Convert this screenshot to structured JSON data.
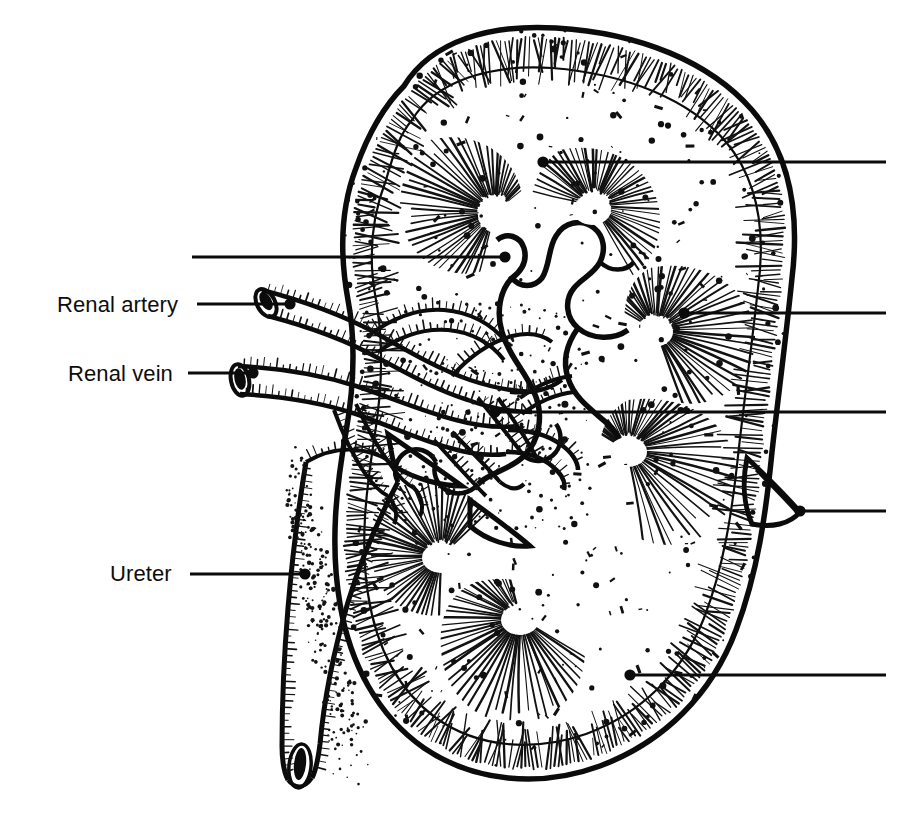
{
  "figure": {
    "background_color": "#ffffff",
    "ink_color": "#0b0b0b",
    "width": 920,
    "height": 821,
    "style": "black-and-white line engraving / stipple illustration"
  },
  "labels": [
    {
      "id": "renal-artery",
      "text": "Renal artery",
      "text_x": 57,
      "text_y": 312,
      "anchor": "start",
      "leader_from_x": 197,
      "leader_to_x": 288,
      "leader_y": 304,
      "dot_x": 290,
      "dot_y": 304,
      "has_dot": true,
      "side": "left"
    },
    {
      "id": "renal-vein",
      "text": "Renal vein",
      "text_x": 68,
      "text_y": 381,
      "anchor": "start",
      "leader_from_x": 188,
      "leader_to_x": 251,
      "leader_y": 373,
      "dot_x": 253,
      "dot_y": 373,
      "has_dot": true,
      "side": "left"
    },
    {
      "id": "ureter",
      "text": "Ureter",
      "text_x": 110,
      "text_y": 581,
      "anchor": "start",
      "leader_from_x": 190,
      "leader_to_x": 303,
      "leader_y": 574,
      "dot_x": 305,
      "dot_y": 574,
      "has_dot": true,
      "side": "left"
    }
  ],
  "unlabeled_leaders": [
    {
      "id": "leader-cortex-upper",
      "text": "",
      "leader_from_x": 543,
      "leader_to_x": 886,
      "leader_y": 162,
      "dot_x": 543,
      "dot_y": 162,
      "has_dot": true,
      "side": "right"
    },
    {
      "id": "leader-renal-column",
      "text": "",
      "leader_from_x": 192,
      "leader_to_x": 503,
      "leader_y": 257,
      "dot_x": 505,
      "dot_y": 257,
      "has_dot": true,
      "side": "left"
    },
    {
      "id": "leader-medulla-pyramid",
      "text": "",
      "leader_from_x": 686,
      "leader_to_x": 886,
      "leader_y": 313,
      "dot_x": 684,
      "dot_y": 313,
      "has_dot": true,
      "side": "right"
    },
    {
      "id": "leader-renal-pelvis",
      "text": "",
      "leader_from_x": 497,
      "leader_to_x": 886,
      "leader_y": 412,
      "dot_x": 495,
      "dot_y": 412,
      "has_dot": true,
      "side": "right"
    },
    {
      "id": "leader-renal-capsule",
      "text": "",
      "leader_from_x": 802,
      "leader_to_x": 886,
      "leader_y": 511,
      "dot_x": 800,
      "dot_y": 511,
      "has_dot": true,
      "side": "right"
    },
    {
      "id": "leader-cortex-lower",
      "text": "",
      "leader_from_x": 632,
      "leader_to_x": 886,
      "leader_y": 675,
      "dot_x": 630,
      "dot_y": 675,
      "has_dot": true,
      "side": "right"
    }
  ],
  "structures": [
    {
      "id": "kidney-outline",
      "name": "kidney capsule outline"
    },
    {
      "id": "renal-cortex",
      "name": "renal cortex (outer stippled band)"
    },
    {
      "id": "renal-pyramids",
      "name": "renal pyramids (radiating striations)"
    },
    {
      "id": "renal-papillae",
      "name": "renal papillae"
    },
    {
      "id": "minor-calyces",
      "name": "minor calyces"
    },
    {
      "id": "renal-pelvis",
      "name": "renal pelvis"
    },
    {
      "id": "renal-artery-vessel",
      "name": "renal artery and segmental branches"
    },
    {
      "id": "renal-vein-vessel",
      "name": "renal vein and tributaries"
    },
    {
      "id": "ureter-tube",
      "name": "ureter"
    },
    {
      "id": "renal-capsule-flap",
      "name": "reflected renal capsule flap"
    }
  ]
}
